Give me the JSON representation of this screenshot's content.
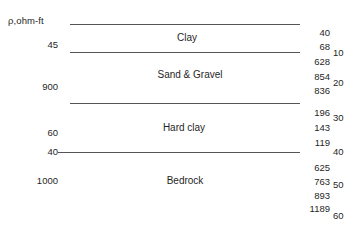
{
  "figure": {
    "header": "ρ,ohm-ft",
    "width": 350,
    "height": 227,
    "line_color": "#555555"
  },
  "chart_data": {
    "type": "table",
    "title": "ρ,ohm-ft",
    "xlabel": "",
    "ylabel": "Depth (m)",
    "layers": [
      {
        "name": "Clay",
        "resistivity": "45",
        "label_x": 187,
        "label_y": 38,
        "top_y": 24,
        "bottom_y": 52
      },
      {
        "name": "Sand & Gravel",
        "resistivity": "900",
        "label_x": 190,
        "label_y": 75,
        "top_y": 52,
        "bottom_y": 103
      },
      {
        "name": "Hard clay",
        "resistivity": "60",
        "label_x": 184,
        "label_y": 128,
        "top_y": 103,
        "bottom_y": 152
      },
      {
        "name": "Bedrock",
        "resistivity": "1000",
        "label_x": 185,
        "label_y": 181,
        "top_y": 152,
        "bottom_y": 227
      }
    ],
    "boundaries": [
      {
        "y": 24,
        "x1": 70,
        "x2": 300,
        "left_label": "",
        "left_label_y": 0
      },
      {
        "y": 52,
        "x1": 70,
        "x2": 300,
        "left_label": "",
        "left_label_y": 0
      },
      {
        "y": 103,
        "x1": 70,
        "x2": 300,
        "left_label": "",
        "left_label_y": 0
      },
      {
        "y": 152,
        "x1": 58,
        "x2": 300,
        "left_label": "40",
        "left_label_y": 152
      }
    ],
    "left_column": {
      "header": "ρ,ohm-ft",
      "header_x": 8,
      "header_y": 16,
      "values": [
        {
          "text": "45",
          "y": 45
        },
        {
          "text": "900",
          "y": 87
        },
        {
          "text": "60",
          "y": 133
        },
        {
          "text": "40",
          "y": 152
        },
        {
          "text": "1000",
          "y": 181
        }
      ]
    },
    "right_column": {
      "values": [
        {
          "text": "40",
          "y": 33
        },
        {
          "text": "68",
          "y": 47
        },
        {
          "text": "628",
          "y": 62
        },
        {
          "text": "854",
          "y": 77
        },
        {
          "text": "836",
          "y": 91
        },
        {
          "text": "196",
          "y": 113
        },
        {
          "text": "143",
          "y": 128
        },
        {
          "text": "119",
          "y": 143
        },
        {
          "text": "625",
          "y": 168
        },
        {
          "text": "763",
          "y": 182
        },
        {
          "text": "893",
          "y": 196
        },
        {
          "text": "1189",
          "y": 209
        }
      ]
    },
    "depth_scale": {
      "unit": "",
      "ticks": [
        {
          "text": "10",
          "y": 53
        },
        {
          "text": "20",
          "y": 83
        },
        {
          "text": "30",
          "y": 118
        },
        {
          "text": "40",
          "y": 152
        },
        {
          "text": "50",
          "y": 185
        },
        {
          "text": "60",
          "y": 216
        }
      ]
    }
  }
}
